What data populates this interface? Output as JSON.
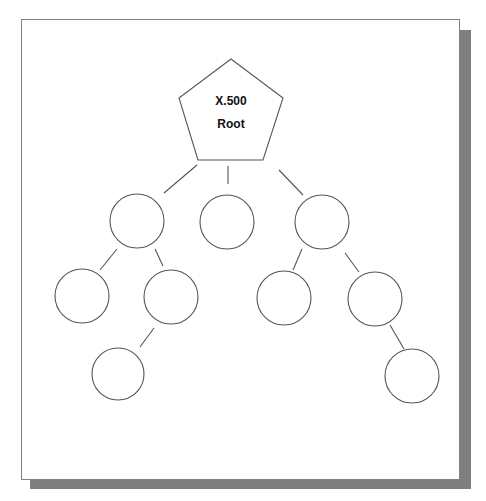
{
  "diagram": {
    "root": {
      "label_line1": "X.500",
      "label_line2": "Root",
      "shape": "pentagon"
    },
    "nodes": [
      {
        "id": "level1-left",
        "shape": "circle",
        "parent": "root"
      },
      {
        "id": "level1-middle",
        "shape": "circle",
        "parent": "root"
      },
      {
        "id": "level1-right",
        "shape": "circle",
        "parent": "root"
      },
      {
        "id": "level2-left-a",
        "shape": "circle",
        "parent": "level1-left"
      },
      {
        "id": "level2-left-b",
        "shape": "circle",
        "parent": "level1-left"
      },
      {
        "id": "level2-right-a",
        "shape": "circle",
        "parent": "level1-right"
      },
      {
        "id": "level2-right-b",
        "shape": "circle",
        "parent": "level1-right"
      },
      {
        "id": "level3-left",
        "shape": "circle",
        "parent": "level2-left-b"
      },
      {
        "id": "level3-right",
        "shape": "circle",
        "parent": "level2-right-b"
      }
    ],
    "colors": {
      "stroke": "#555555",
      "shadow": "#7f7f7f",
      "background": "#ffffff"
    }
  }
}
